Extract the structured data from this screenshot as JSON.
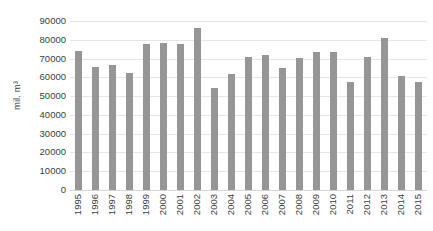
{
  "chart_data": {
    "type": "bar",
    "title": "",
    "xlabel": "",
    "ylabel": "mil. m³",
    "ylim": [
      0,
      90000
    ],
    "ytick_step": 10000,
    "yticks": [
      90000,
      80000,
      70000,
      60000,
      50000,
      40000,
      30000,
      20000,
      10000,
      0
    ],
    "ytick_labels": [
      "90000",
      "80000",
      "70000",
      "60000",
      "50000",
      "40000",
      "30000",
      "20000",
      "10000",
      "0"
    ],
    "grid": "horizontal",
    "legend": "none",
    "bar_color": "#969696",
    "gridline_color": "#e4e7ea",
    "axis_text_color": "#404040",
    "categories": [
      "1995",
      "1996",
      "1997",
      "1998",
      "1999",
      "2000",
      "2001",
      "2002",
      "2003",
      "2004",
      "2005",
      "2006",
      "2007",
      "2008",
      "2009",
      "2010",
      "2011",
      "2012",
      "2013",
      "2014",
      "2015"
    ],
    "values": [
      74000,
      65500,
      66500,
      62500,
      78000,
      78500,
      77500,
      86500,
      54500,
      62000,
      71000,
      72000,
      65000,
      70500,
      73500,
      73500,
      57500,
      71000,
      81000,
      60500,
      57500
    ]
  }
}
